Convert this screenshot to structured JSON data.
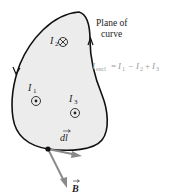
{
  "diagram": {
    "plane_label": {
      "line1": "Plane of",
      "line2": "curve"
    },
    "equation": {
      "lhs_symbol": "I",
      "lhs_sub": "encl",
      "rhs": [
        {
          "sign": "=",
          "symbol": "I",
          "sub": "1"
        },
        {
          "sign": "−",
          "symbol": "I",
          "sub": "2"
        },
        {
          "sign": "+",
          "symbol": "I",
          "sub": "3"
        }
      ]
    },
    "currents": [
      {
        "symbol": "I",
        "sub": "1",
        "direction": "out-of-page",
        "marker": "dot-in-circle"
      },
      {
        "symbol": "I",
        "sub": "2",
        "direction": "into-page",
        "marker": "cross-in-circle"
      },
      {
        "symbol": "I",
        "sub": "3",
        "direction": "out-of-page",
        "marker": "dot-in-circle"
      }
    ],
    "vectors": {
      "dl": "dl",
      "B": "B"
    },
    "colors": {
      "curve_fill": "#ececec",
      "curve_stroke": "#111111",
      "vector_gray": "#8a8a8a",
      "equation_gray": "#9a9a9a",
      "text": "#222222"
    }
  }
}
